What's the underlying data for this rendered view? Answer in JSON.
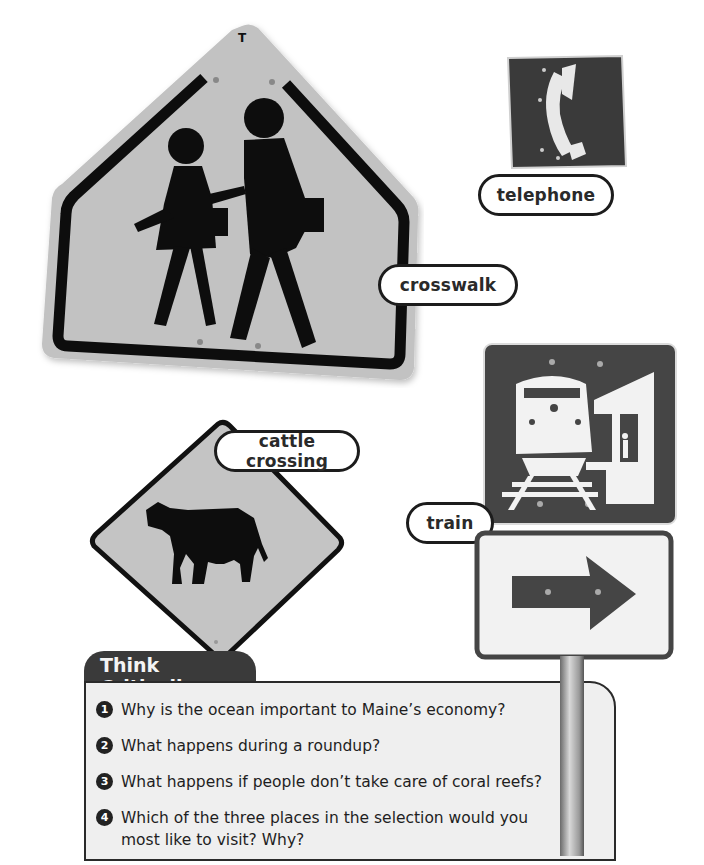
{
  "signs": {
    "crosswalk": {
      "label": "crosswalk",
      "icon": "school-crosswalk-sign",
      "fill": "#bdbdbd",
      "border": "#0d0d0d"
    },
    "telephone": {
      "label": "telephone",
      "icon": "telephone-sign",
      "fill": "#3a3a3a",
      "symbol": "#e8e8e8"
    },
    "cattle_crossing": {
      "label": "cattle crossing",
      "icon": "cattle-crossing-sign",
      "fill": "#c4c4c4",
      "border": "#111111"
    },
    "train": {
      "label": "train",
      "icon": "train-station-sign",
      "fill": "#454545",
      "symbol": "#f2f2f2"
    },
    "arrow": {
      "icon": "right-arrow-sign",
      "fill": "#f2f2f2",
      "symbol": "#454545"
    }
  },
  "think_critically": {
    "title": "Think Critically",
    "questions": [
      {
        "number": "1",
        "text": "Why is the ocean important to Maine’s economy?"
      },
      {
        "number": "2",
        "text": "What happens during a roundup?"
      },
      {
        "number": "3",
        "text": "What happens if people don’t take care of coral reefs?"
      },
      {
        "number": "4",
        "text": "Which of the three places in the selection would you most like to visit? Why?"
      }
    ]
  }
}
